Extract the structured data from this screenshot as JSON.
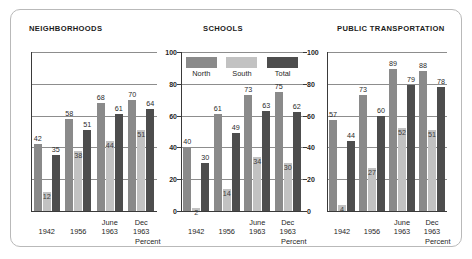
{
  "chart_data": {
    "type": "bar",
    "title": "",
    "xlabel": "Percent",
    "ylabel": "",
    "ylim": [
      0,
      100
    ],
    "yticks": [
      0,
      20,
      40,
      60,
      80,
      100
    ],
    "grid": true,
    "legend_position": "top-center",
    "categories": [
      "1942",
      "1956",
      "June 1963",
      "Dec 1963"
    ],
    "category_lines": [
      [
        "1942",
        ""
      ],
      [
        "1956",
        ""
      ],
      [
        "June",
        "1963"
      ],
      [
        "Dec",
        "1963"
      ]
    ],
    "legend": [
      {
        "name": "North",
        "color": "#8a8a8a"
      },
      {
        "name": "South",
        "color": "#c2c2c2"
      },
      {
        "name": "Total",
        "color": "#4d4d4d"
      }
    ],
    "panels": [
      {
        "title": "NEIGHBORHOODS",
        "xlabel": "Percent",
        "series": [
          {
            "name": "North",
            "values": [
              42,
              58,
              68,
              70
            ]
          },
          {
            "name": "South",
            "values": [
              12,
              38,
              44,
              51
            ]
          },
          {
            "name": "Total",
            "values": [
              35,
              51,
              61,
              64
            ]
          }
        ]
      },
      {
        "title": "SCHOOLS",
        "xlabel": "Percent",
        "series": [
          {
            "name": "North",
            "values": [
              40,
              61,
              73,
              75
            ]
          },
          {
            "name": "South",
            "values": [
              2,
              14,
              34,
              30
            ]
          },
          {
            "name": "Total",
            "values": [
              30,
              49,
              63,
              62
            ]
          }
        ]
      },
      {
        "title": "PUBLIC TRANSPORTATION",
        "xlabel": "Percent",
        "series": [
          {
            "name": "North",
            "values": [
              57,
              73,
              89,
              88
            ]
          },
          {
            "name": "South",
            "values": [
              4,
              27,
              52,
              51
            ]
          },
          {
            "name": "Total",
            "values": [
              44,
              60,
              79,
              78
            ]
          }
        ]
      }
    ]
  }
}
